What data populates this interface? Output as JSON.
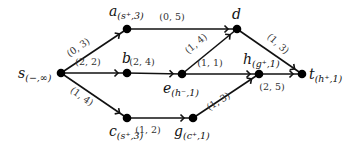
{
  "diagram": {
    "type": "flow-network",
    "nodes": [
      {
        "id": "s",
        "name": "s",
        "label": "(−,∞)",
        "x": 61,
        "y": 73,
        "lx": 18,
        "ly": 78
      },
      {
        "id": "a",
        "name": "a",
        "label": "(s⁺,3)",
        "x": 127,
        "y": 29,
        "lx": 109,
        "ly": 16
      },
      {
        "id": "b",
        "name": "b",
        "label": "",
        "x": 127,
        "y": 73,
        "lx": 122,
        "ly": 63
      },
      {
        "id": "c",
        "name": "c",
        "label": "(s⁺,3)",
        "x": 127,
        "y": 118,
        "lx": 109,
        "ly": 136
      },
      {
        "id": "d",
        "name": "d",
        "label": "",
        "x": 237,
        "y": 29,
        "lx": 232,
        "ly": 19
      },
      {
        "id": "e",
        "name": "e",
        "label": "(h⁻,1)",
        "x": 182,
        "y": 74,
        "lx": 163,
        "ly": 93
      },
      {
        "id": "g",
        "name": "g",
        "label": "(c⁺,1)",
        "x": 193,
        "y": 118,
        "lx": 174,
        "ly": 136
      },
      {
        "id": "h",
        "name": "h",
        "label": "(g⁺,1)",
        "x": 259,
        "y": 74,
        "lx": 243,
        "ly": 64
      },
      {
        "id": "t",
        "name": "t",
        "label": "(h⁺,1)",
        "x": 302,
        "y": 74,
        "lx": 309,
        "ly": 79
      }
    ],
    "edges": [
      {
        "from": "s",
        "to": "a",
        "label": "(0, 3)",
        "lx": 80,
        "ly": 50,
        "rot": -34
      },
      {
        "from": "a",
        "to": "d",
        "label": "(0, 5)",
        "lx": 172,
        "ly": 20,
        "rot": 0
      },
      {
        "from": "s",
        "to": "b",
        "label": "(2, 2)",
        "lx": 88,
        "ly": 65,
        "rot": 0
      },
      {
        "from": "b",
        "to": "e",
        "label": "(2, 4)",
        "lx": 142,
        "ly": 65,
        "rot": 0
      },
      {
        "from": "e",
        "to": "d",
        "label": "(1, 4)",
        "lx": 198,
        "ly": 46,
        "rot": -40
      },
      {
        "from": "e",
        "to": "h",
        "label": "(1, 1)",
        "lx": 210,
        "ly": 66,
        "rot": 0
      },
      {
        "from": "d",
        "to": "t",
        "label": "(1, 3)",
        "lx": 276,
        "ly": 46,
        "rot": 42
      },
      {
        "from": "h",
        "to": "t",
        "label": "(2, 5)",
        "lx": 272,
        "ly": 90,
        "rot": 0
      },
      {
        "from": "s",
        "to": "c",
        "label": "(1, 4)",
        "lx": 80,
        "ly": 99,
        "rot": 35
      },
      {
        "from": "c",
        "to": "g",
        "label": "(1, 2)",
        "lx": 148,
        "ly": 133,
        "rot": 0
      },
      {
        "from": "g",
        "to": "h",
        "label": "(1, 3)",
        "lx": 220,
        "ly": 104,
        "rot": -32
      }
    ]
  }
}
